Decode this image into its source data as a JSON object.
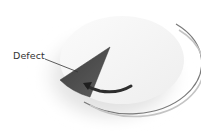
{
  "diagram": {
    "label": "Defect",
    "elements": {
      "disc": "circular disc viewed in perspective",
      "wedge": "dark triangular defect region on disc",
      "arrow": "curved arrow indicating rotation toward defect",
      "leader_line": "line connecting label to defect"
    },
    "colors": {
      "disc_fill": "#f4f4f4",
      "disc_edge": "#6a6a6a",
      "wedge_fill": "#505050",
      "arrow": "#2e2e2e",
      "shadow": "#d8d8d8",
      "label": "#333333"
    }
  }
}
